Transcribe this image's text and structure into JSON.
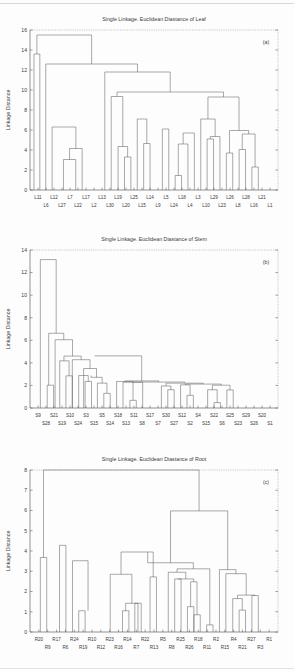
{
  "document": {
    "kind": "figure-page",
    "figure_caption_tags": [
      "(a)",
      "(b)",
      "(c)"
    ]
  },
  "chart_data": [
    {
      "id": "leaf",
      "type": "dendrogram",
      "tag": "(a)",
      "title": "Single Linkage. Euclidean Diastance of Leaf",
      "xlabel": "",
      "ylabel": "Linkage Distance",
      "ylim": [
        0,
        16
      ],
      "yticks": [
        0,
        2,
        4,
        6,
        8,
        10,
        12,
        14,
        16
      ],
      "grid": false,
      "leaves": [
        "L11",
        "L6",
        "L12",
        "L27",
        "L7",
        "L22",
        "L17",
        "L2",
        "L13",
        "L30",
        "L19",
        "L20",
        "L25",
        "L15",
        "L14",
        "L9",
        "L5",
        "L24",
        "L18",
        "L4",
        "L3",
        "L10",
        "L29",
        "L23",
        "L26",
        "L8",
        "L28",
        "L16",
        "L21",
        "L1"
      ],
      "merges": [
        {
          "a": 0,
          "b": 1,
          "height": 13.6
        },
        {
          "a": 5,
          "b": 6,
          "height": 3.05
        },
        {
          "a": 6,
          "b": 7,
          "height": 4.15
        },
        {
          "a": 3,
          "b": 4,
          "height": 6.3
        },
        {
          "a": 11,
          "b": 12,
          "height": 3.3
        },
        {
          "a": 12,
          "b": 13,
          "height": 4.35
        },
        {
          "a": 13,
          "b": 14,
          "height": 4.65
        },
        {
          "a": 14,
          "b": 15,
          "height": 7.1
        },
        {
          "a": 10,
          "b": 11,
          "height": 9.35
        },
        {
          "a": 16,
          "b": 17,
          "height": 6.1
        },
        {
          "a": 17,
          "b": 18,
          "height": 1.45
        },
        {
          "a": 18,
          "b": 19,
          "height": 4.6
        },
        {
          "a": 19,
          "b": 20,
          "height": 5.7
        },
        {
          "a": 22,
          "b": 23,
          "height": 5.1
        },
        {
          "a": 23,
          "b": 24,
          "height": 5.35
        },
        {
          "a": 24,
          "b": 25,
          "height": 3.7
        },
        {
          "a": 21,
          "b": 22,
          "height": 7.1
        },
        {
          "a": 26,
          "b": 27,
          "height": 4.05
        },
        {
          "a": 28,
          "b": 29,
          "height": 2.3
        },
        {
          "a": 27,
          "b": 28,
          "height": 5.6
        },
        {
          "a": 25,
          "b": 26,
          "height": 5.95
        },
        {
          "a": 20,
          "b": 21,
          "height": 9.3
        },
        {
          "a": 9,
          "b": 10,
          "height": 9.8
        },
        {
          "a": 8,
          "b": 9,
          "height": 11.8
        },
        {
          "a": 2,
          "b": 3,
          "height": 12.6
        },
        {
          "a": 1,
          "b": 2,
          "height": 15.5
        }
      ],
      "structure": [
        {
          "x1": 32.0,
          "x2": 38.0,
          "h": 13.6,
          "d1": 0,
          "d2": 0
        },
        {
          "x1": 62.0,
          "x2": 74.5,
          "h": 3.05,
          "d1": 0,
          "d2": 0
        },
        {
          "x1": 68.2,
          "x2": 81.0,
          "h": 4.15,
          "d1": 3.05,
          "d2": 0
        },
        {
          "x1": 50.5,
          "x2": 74.6,
          "h": 6.3,
          "d1": 0,
          "d2": 4.15
        },
        {
          "x1": 124.0,
          "x2": 130.5,
          "h": 3.3,
          "d1": 0,
          "d2": 0
        },
        {
          "x1": 117.5,
          "x2": 127.2,
          "h": 4.35,
          "d1": 0,
          "d2": 3.3
        },
        {
          "x1": 143.5,
          "x2": 150.0,
          "h": 4.65,
          "d1": 0,
          "d2": 0
        },
        {
          "x1": 137.0,
          "x2": 146.7,
          "h": 7.1,
          "d1": 0,
          "d2": 4.65
        },
        {
          "x1": 110.5,
          "x2": 122.3,
          "h": 9.35,
          "d1": 0,
          "d2": 4.35
        },
        {
          "x1": 162.5,
          "x2": 169.0,
          "h": 6.1,
          "d1": 0,
          "d2": 0
        },
        {
          "x1": 175.5,
          "x2": 182.0,
          "h": 1.45,
          "d1": 0,
          "d2": 0
        },
        {
          "x1": 178.7,
          "x2": 188.5,
          "h": 4.6,
          "d1": 1.45,
          "d2": 0
        },
        {
          "x1": 183.6,
          "x2": 195.0,
          "h": 5.7,
          "d1": 4.6,
          "d2": 0
        },
        {
          "x1": 208.0,
          "x2": 214.5,
          "h": 5.1,
          "d1": 0,
          "d2": 0
        },
        {
          "x1": 211.2,
          "x2": 221.0,
          "h": 5.35,
          "d1": 5.1,
          "d2": 0
        },
        {
          "x1": 227.5,
          "x2": 234.0,
          "h": 3.7,
          "d1": 0,
          "d2": 0
        },
        {
          "x1": 201.5,
          "x2": 216.1,
          "h": 7.1,
          "d1": 0,
          "d2": 5.35
        },
        {
          "x1": 240.5,
          "x2": 247.0,
          "h": 4.05,
          "d1": 0,
          "d2": 0
        },
        {
          "x1": 253.5,
          "x2": 260.0,
          "h": 2.3,
          "d1": 0,
          "d2": 0
        },
        {
          "x1": 243.7,
          "x2": 256.7,
          "h": 5.6,
          "d1": 4.05,
          "d2": 2.3
        },
        {
          "x1": 230.7,
          "x2": 250.2,
          "h": 5.95,
          "d1": 3.7,
          "d2": 5.6
        },
        {
          "x1": 208.8,
          "x2": 240.4,
          "h": 9.3,
          "d1": 7.1,
          "d2": 5.95
        },
        {
          "x1": 116.4,
          "x2": 224.6,
          "h": 9.8,
          "d1": 9.35,
          "d2": 9.3
        },
        {
          "x1": 104.0,
          "x2": 170.5,
          "h": 11.8,
          "d1": 0,
          "d2": 9.8
        },
        {
          "x1": 44.0,
          "x2": 137.2,
          "h": 12.6,
          "d1": 0,
          "d2": 11.8
        },
        {
          "x1": 35.0,
          "x2": 90.6,
          "h": 15.5,
          "d1": 13.6,
          "d2": 12.6
        }
      ]
    },
    {
      "id": "stem",
      "type": "dendrogram",
      "tag": "(b)",
      "title": "Single Linkage. Euclidean Diastance of Stem",
      "xlabel": "",
      "ylabel": "Linkage Distance",
      "ylim": [
        0,
        14
      ],
      "yticks": [
        0,
        2,
        4,
        6,
        8,
        10,
        12,
        14
      ],
      "grid": false,
      "leaves": [
        "S9",
        "S28",
        "S21",
        "S19",
        "S10",
        "S24",
        "S3",
        "S15",
        "S5",
        "S14",
        "S18",
        "S13",
        "S11",
        "S8",
        "S17",
        "S7",
        "S30",
        "S27",
        "S12",
        "S2",
        "S4",
        "S15b",
        "S22",
        "S6",
        "S25",
        "S23",
        "S29",
        "S26",
        "S20",
        "S1"
      ],
      "structure": [
        {
          "x1": 45.5,
          "x2": 52.0,
          "h": 2.02,
          "d1": 0,
          "d2": 0
        },
        {
          "x1": 64.5,
          "x2": 71.0,
          "h": 2.85,
          "d1": 0,
          "d2": 0
        },
        {
          "x1": 58.2,
          "x2": 67.7,
          "h": 4.18,
          "d1": 0,
          "d2": 2.85
        },
        {
          "x1": 84.0,
          "x2": 90.5,
          "h": 2.35,
          "d1": 0,
          "d2": 0
        },
        {
          "x1": 77.5,
          "x2": 87.2,
          "h": 2.88,
          "d1": 0,
          "d2": 2.35
        },
        {
          "x1": 103.0,
          "x2": 109.5,
          "h": 1.3,
          "d1": 0,
          "d2": 0
        },
        {
          "x1": 96.5,
          "x2": 106.2,
          "h": 2.2,
          "d1": 0,
          "d2": 1.3
        },
        {
          "x1": 90.0,
          "x2": 101.3,
          "h": 2.72,
          "d1": 2.88,
          "d2": 2.2
        },
        {
          "x1": 82.5,
          "x2": 95.6,
          "h": 3.5,
          "d1": 0,
          "d2": 2.72
        },
        {
          "x1": 71.0,
          "x2": 89.0,
          "h": 4.28,
          "d1": 0,
          "d2": 3.5
        },
        {
          "x1": 62.5,
          "x2": 80.0,
          "h": 4.6,
          "d1": 4.18,
          "d2": 4.28
        },
        {
          "x1": 53.5,
          "x2": 71.2,
          "h": 6.05,
          "d1": 0,
          "d2": 4.6
        },
        {
          "x1": 47.0,
          "x2": 62.3,
          "h": 6.62,
          "d1": 2.02,
          "d2": 6.05
        },
        {
          "x1": 38.5,
          "x2": 54.6,
          "h": 13.15,
          "d1": 0,
          "d2": 6.62
        },
        {
          "x1": 129.5,
          "x2": 136.0,
          "h": 0.68,
          "d1": 0,
          "d2": 0
        },
        {
          "x1": 116.0,
          "x2": 132.7,
          "h": 2.35,
          "d1": 0,
          "d2": 0.68
        },
        {
          "x1": 122.5,
          "x2": 142.5,
          "h": 2.28,
          "d1": 0,
          "d2": 0
        },
        {
          "x1": 168.0,
          "x2": 174.5,
          "h": 1.62,
          "d1": 0,
          "d2": 0
        },
        {
          "x1": 161.5,
          "x2": 171.2,
          "h": 1.95,
          "d1": 0,
          "d2": 1.62
        },
        {
          "x1": 187.5,
          "x2": 194.0,
          "h": 1.12,
          "d1": 0,
          "d2": 0
        },
        {
          "x1": 181.0,
          "x2": 190.7,
          "h": 2.05,
          "d1": 0,
          "d2": 1.12
        },
        {
          "x1": 215.0,
          "x2": 221.5,
          "h": 0.48,
          "d1": 0,
          "d2": 0
        },
        {
          "x1": 208.5,
          "x2": 218.2,
          "h": 1.62,
          "d1": 0,
          "d2": 0.48
        },
        {
          "x1": 228.0,
          "x2": 234.5,
          "h": 1.6,
          "d1": 0,
          "d2": 0
        },
        {
          "x1": 213.3,
          "x2": 231.2,
          "h": 2.02,
          "d1": 1.62,
          "d2": 1.6
        },
        {
          "x1": 185.8,
          "x2": 222.2,
          "h": 2.12,
          "d1": 2.05,
          "d2": 2.02
        },
        {
          "x1": 166.3,
          "x2": 204.0,
          "h": 2.2,
          "d1": 1.95,
          "d2": 2.12
        },
        {
          "x1": 132.5,
          "x2": 185.1,
          "h": 2.3,
          "d1": 2.28,
          "d2": 2.2
        },
        {
          "x1": 124.2,
          "x2": 158.8,
          "h": 2.4,
          "d1": 2.35,
          "d2": 2.3
        },
        {
          "x1": 93.8,
          "x2": 141.5,
          "h": 4.62,
          "d1": 4.6,
          "d2": 2.4
        }
      ]
    },
    {
      "id": "root",
      "type": "dendrogram",
      "tag": "(c)",
      "title": "Single Linkage. Euclidean Diastance of Root",
      "xlabel": "",
      "ylabel": "Linkage Distance",
      "ylim": [
        0,
        8
      ],
      "yticks": [
        0,
        1,
        2,
        3,
        4,
        5,
        6,
        7,
        8
      ],
      "grid": false,
      "leaves": [
        "R20",
        "R9",
        "R17",
        "R6",
        "R24",
        "R19",
        "R10",
        "R12",
        "R23",
        "R16",
        "R14",
        "R7",
        "R22",
        "R13",
        "R5",
        "R8",
        "R25",
        "R26",
        "R18",
        "R11",
        "R2",
        "R15",
        "R4",
        "R21",
        "R27",
        "R3",
        "R1"
      ],
      "structure": [
        {
          "x1": 38.5,
          "x2": 45.0,
          "h": 3.68,
          "d1": 0,
          "d2": 0
        },
        {
          "x1": 58.0,
          "x2": 64.5,
          "h": 4.28,
          "d1": 0,
          "d2": 0
        },
        {
          "x1": 77.5,
          "x2": 84.0,
          "h": 1.05,
          "d1": 0,
          "d2": 0
        },
        {
          "x1": 71.2,
          "x2": 87.0,
          "h": 3.52,
          "d1": 0,
          "d2": 1.05
        },
        {
          "x1": 122.0,
          "x2": 128.5,
          "h": 1.05,
          "d1": 0,
          "d2": 0
        },
        {
          "x1": 134.5,
          "x2": 141.0,
          "h": 1.42,
          "d1": 0,
          "d2": 0
        },
        {
          "x1": 125.2,
          "x2": 137.7,
          "h": 1.42,
          "d1": 1.05,
          "d2": 0
        },
        {
          "x1": 109.5,
          "x2": 131.5,
          "h": 2.85,
          "d1": 0,
          "d2": 1.42
        },
        {
          "x1": 150.0,
          "x2": 156.5,
          "h": 2.72,
          "d1": 0,
          "d2": 0
        },
        {
          "x1": 120.5,
          "x2": 153.2,
          "h": 3.95,
          "d1": 2.85,
          "d2": 2.72
        },
        {
          "x1": 175.0,
          "x2": 181.5,
          "h": 2.62,
          "d1": 0,
          "d2": 0
        },
        {
          "x1": 188.0,
          "x2": 194.5,
          "h": 1.25,
          "d1": 0,
          "d2": 0
        },
        {
          "x1": 194.5,
          "x2": 201.0,
          "h": 0.85,
          "d1": 0,
          "d2": 0
        },
        {
          "x1": 191.2,
          "x2": 197.7,
          "h": 2.48,
          "d1": 1.25,
          "d2": 0.85
        },
        {
          "x1": 178.2,
          "x2": 194.4,
          "h": 2.62,
          "d1": 2.62,
          "d2": 2.48
        },
        {
          "x1": 168.5,
          "x2": 186.3,
          "h": 2.95,
          "d1": 0,
          "d2": 2.62
        },
        {
          "x1": 207.5,
          "x2": 214.0,
          "h": 0.35,
          "d1": 0,
          "d2": 0
        },
        {
          "x1": 177.4,
          "x2": 210.7,
          "h": 3.12,
          "d1": 2.95,
          "d2": 0.35
        },
        {
          "x1": 147.6,
          "x2": 194.0,
          "h": 3.42,
          "d1": 3.95,
          "d2": 3.12
        },
        {
          "x1": 240.5,
          "x2": 247.0,
          "h": 1.08,
          "d1": 0,
          "d2": 0
        },
        {
          "x1": 234.0,
          "x2": 243.7,
          "h": 1.65,
          "d1": 0,
          "d2": 1.08
        },
        {
          "x1": 253.5,
          "x2": 260.0,
          "h": 1.8,
          "d1": 0,
          "d2": 0
        },
        {
          "x1": 238.8,
          "x2": 256.7,
          "h": 1.82,
          "d1": 1.65,
          "d2": 1.8
        },
        {
          "x1": 227.0,
          "x2": 247.7,
          "h": 2.88,
          "d1": 0,
          "d2": 1.82
        },
        {
          "x1": 220.5,
          "x2": 237.3,
          "h": 3.08,
          "d1": 0,
          "d2": 2.88
        },
        {
          "x1": 170.8,
          "x2": 228.9,
          "h": 5.98,
          "d1": 3.42,
          "d2": 3.08
        },
        {
          "x1": 41.7,
          "x2": 199.8,
          "h": 8.0,
          "d1": 3.68,
          "d2": 5.98
        }
      ]
    }
  ]
}
